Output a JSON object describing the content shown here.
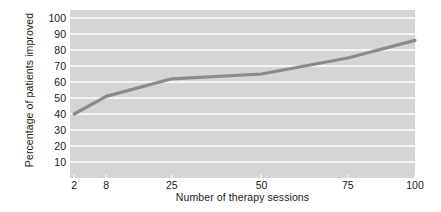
{
  "chart_data": {
    "type": "line",
    "title": "",
    "xlabel": "Number of therapy sessions",
    "ylabel": "Percentage of patients improved",
    "x": [
      2,
      8,
      25,
      50,
      75,
      100
    ],
    "values": [
      40,
      51,
      62,
      65,
      75,
      86
    ],
    "series": [
      {
        "name": "Percentage of patients improved",
        "values": [
          40,
          51,
          62,
          65,
          75,
          86
        ]
      }
    ],
    "xtick_labels": [
      "2",
      "8",
      "25",
      "50",
      "75",
      "100"
    ],
    "ytick_labels": [
      "10",
      "20",
      "30",
      "40",
      "50",
      "60",
      "70",
      "80",
      "90",
      "100"
    ],
    "ylim": [
      0,
      105
    ],
    "grid": "horizontal",
    "legend": "none",
    "colors": {
      "plot_background": "#d5d5d5",
      "gridline": "#f4f4f4",
      "line": "#8a8a8a",
      "text": "#1a1a1a",
      "figure_background": "#ffffff"
    }
  }
}
